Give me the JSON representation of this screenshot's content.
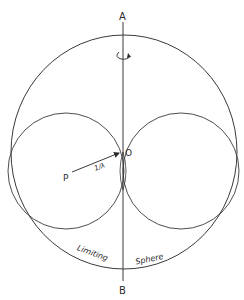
{
  "diagram": {
    "labels": {
      "axis_top": "A",
      "axis_bottom": "B",
      "origin": "O",
      "point": "P",
      "vector": "1/λ",
      "sphere_word1": "Limiting",
      "sphere_word2": "Sphere"
    },
    "icons": {
      "rotation": "rotation-arrow-icon"
    },
    "colors": {
      "line": "#3a3a3a",
      "background": "#ffffff"
    }
  }
}
